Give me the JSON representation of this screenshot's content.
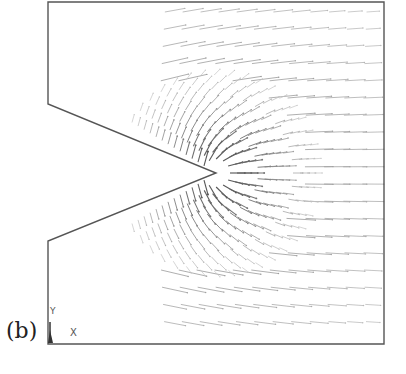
{
  "figure": {
    "panel_label": "(b)",
    "axis_triad": {
      "x_label": "X",
      "y_label": "Y"
    },
    "colors": {
      "frame": "#555555",
      "arrow_dark": "#444444",
      "arrow_light": "#bbbbbb"
    },
    "geometry": {
      "frame": {
        "left": 48,
        "top": 2,
        "right": 384,
        "bottom": 344
      },
      "notch": {
        "upper_corner": [
          48,
          104
        ],
        "tip": [
          216,
          173
        ],
        "lower_corner": [
          48,
          241
        ]
      }
    }
  }
}
